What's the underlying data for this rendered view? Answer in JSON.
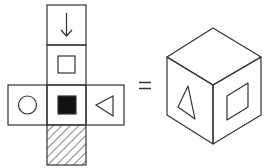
{
  "title": "Cube net and folded cube",
  "net": {
    "faces": [
      {
        "position": "top",
        "symbol": "down-arrow"
      },
      {
        "position": "upper-middle",
        "symbol": "hollow-square"
      },
      {
        "position": "left",
        "symbol": "hollow-circle"
      },
      {
        "position": "center",
        "symbol": "filled-square"
      },
      {
        "position": "right",
        "symbol": "left-pointing-triangle"
      },
      {
        "position": "bottom",
        "symbol": "diagonal-hatching"
      }
    ]
  },
  "operator": "=",
  "cube": {
    "visible_faces": [
      {
        "face": "top",
        "symbol": "blank"
      },
      {
        "face": "left-front",
        "symbol": "triangle"
      },
      {
        "face": "right-front",
        "symbol": "hollow-square"
      }
    ]
  },
  "colors": {
    "stroke": "#333333",
    "fill_dark": "#111111",
    "background": "#ffffff"
  }
}
